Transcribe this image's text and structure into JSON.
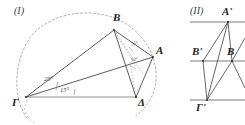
{
  "figures": [
    {
      "id": "figure-1",
      "caption": "(I)",
      "points": [
        {
          "name": "B",
          "label": "B"
        },
        {
          "name": "A",
          "label": "A"
        },
        {
          "name": "G",
          "label": "Γ"
        },
        {
          "name": "D",
          "label": "Δ"
        }
      ],
      "angles": [
        {
          "name": "angle-gamma-outer",
          "label": "20°"
        },
        {
          "name": "angle-gamma-inner",
          "label": "15°"
        },
        {
          "name": "angle-b-upper",
          "label": "35°"
        },
        {
          "name": "angle-b-lower",
          "label": "50°"
        }
      ],
      "arc": {
        "name": "dashed-circle-arc",
        "style": "dashed"
      }
    },
    {
      "id": "figure-2",
      "caption": "(II)",
      "points": [
        {
          "name": "A-prime",
          "label": "A'"
        },
        {
          "name": "B-prime",
          "label": "B'"
        },
        {
          "name": "B",
          "label": "B"
        },
        {
          "name": "G-prime",
          "label": "Γ'"
        }
      ],
      "parallel_lines": 3
    }
  ],
  "colors": {
    "stroke": "#4a4a4a",
    "stroke_light": "#8a8a8a",
    "text": "#1e1e1e",
    "background": "#ffffff"
  }
}
